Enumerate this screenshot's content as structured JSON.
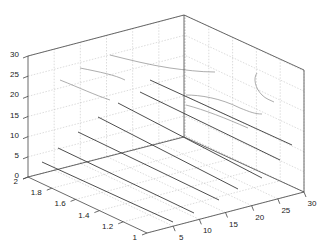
{
  "chart_data": {
    "type": "line3d",
    "title": "",
    "xlabel": "",
    "ylabel": "",
    "zlabel": "",
    "x_ticks": [
      "1",
      "1.2",
      "1.4",
      "1.6",
      "1.8",
      "2"
    ],
    "y_ticks": [
      "5",
      "10",
      "15",
      "20",
      "25",
      "30"
    ],
    "z_ticks": [
      "0",
      "5",
      "10",
      "15",
      "20",
      "25",
      "30"
    ],
    "xlim": [
      1,
      2
    ],
    "ylim": [
      0,
      30
    ],
    "zlim": [
      0,
      30
    ],
    "grid": true,
    "legend": null,
    "series": [
      {
        "name": "line-1",
        "z": 0,
        "x": 2,
        "y": [
          0,
          30
        ]
      },
      {
        "name": "line-2",
        "z": 3,
        "x": 2,
        "y": [
          0,
          30
        ]
      },
      {
        "name": "line-3",
        "z": 6,
        "x": 2,
        "y": [
          0,
          30
        ]
      },
      {
        "name": "line-4",
        "z": 10,
        "x": 2,
        "y": [
          0,
          30
        ]
      },
      {
        "name": "line-5",
        "z": 13,
        "x": 2,
        "y": [
          0,
          30
        ]
      },
      {
        "name": "line-6",
        "z": 17,
        "x": 2,
        "y": [
          0,
          30
        ]
      },
      {
        "name": "line-7",
        "z": 20,
        "x": 2,
        "y": [
          0,
          30
        ]
      }
    ]
  }
}
